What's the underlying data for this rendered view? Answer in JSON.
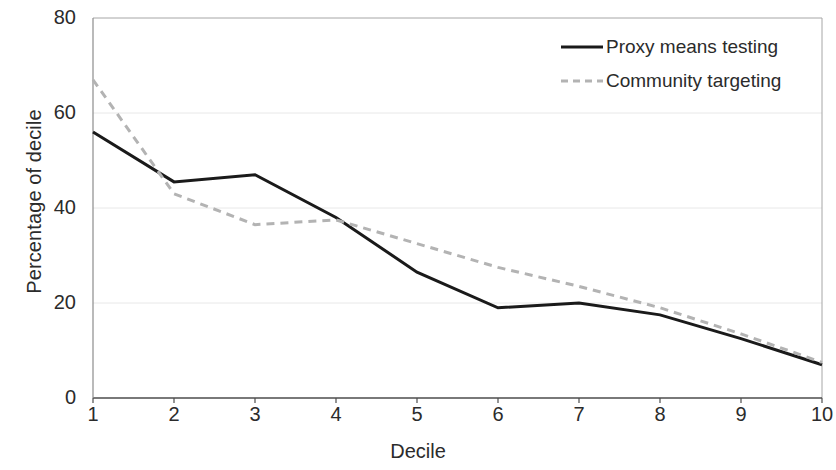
{
  "chart_data": {
    "type": "line",
    "title": "",
    "xlabel": "Decile",
    "ylabel": "Percentage of decile",
    "categories": [
      "1",
      "2",
      "3",
      "4",
      "5",
      "6",
      "7",
      "8",
      "9",
      "10"
    ],
    "x": [
      1,
      2,
      3,
      4,
      5,
      6,
      7,
      8,
      9,
      10
    ],
    "xlim": [
      1,
      10
    ],
    "ylim": [
      0,
      80
    ],
    "yticks": [
      0,
      20,
      40,
      60,
      80
    ],
    "ytick_labels": [
      "0",
      "20",
      "40",
      "60",
      "80"
    ],
    "xticks": [
      1,
      2,
      3,
      4,
      5,
      6,
      7,
      8,
      9,
      10
    ],
    "grid": "horizontal-faint",
    "legend_position": "top-right",
    "series": [
      {
        "name": "Proxy means testing",
        "style": "solid",
        "color": "#1a1a1a",
        "width": 3,
        "values": [
          56,
          45.5,
          47,
          38,
          26.5,
          19,
          20,
          17.5,
          12.5,
          7
        ]
      },
      {
        "name": "Community targeting",
        "style": "dashed",
        "color": "#b3b3b3",
        "width": 3,
        "values": [
          67,
          43,
          36.5,
          37.5,
          32.5,
          27.5,
          23.5,
          19,
          13.5,
          7.5
        ]
      }
    ]
  },
  "legend": {
    "items": [
      {
        "label": "Proxy means testing",
        "style": "solid",
        "color": "#1a1a1a"
      },
      {
        "label": "Community targeting",
        "style": "dashed",
        "color": "#b3b3b3"
      }
    ]
  },
  "axes": {
    "x_title": "Decile",
    "y_title": "Percentage of decile"
  },
  "colors": {
    "plot_border": "#a6a6a6",
    "gridline": "#e8e8e8",
    "background": "#ffffff",
    "text": "#2b2b2b"
  }
}
